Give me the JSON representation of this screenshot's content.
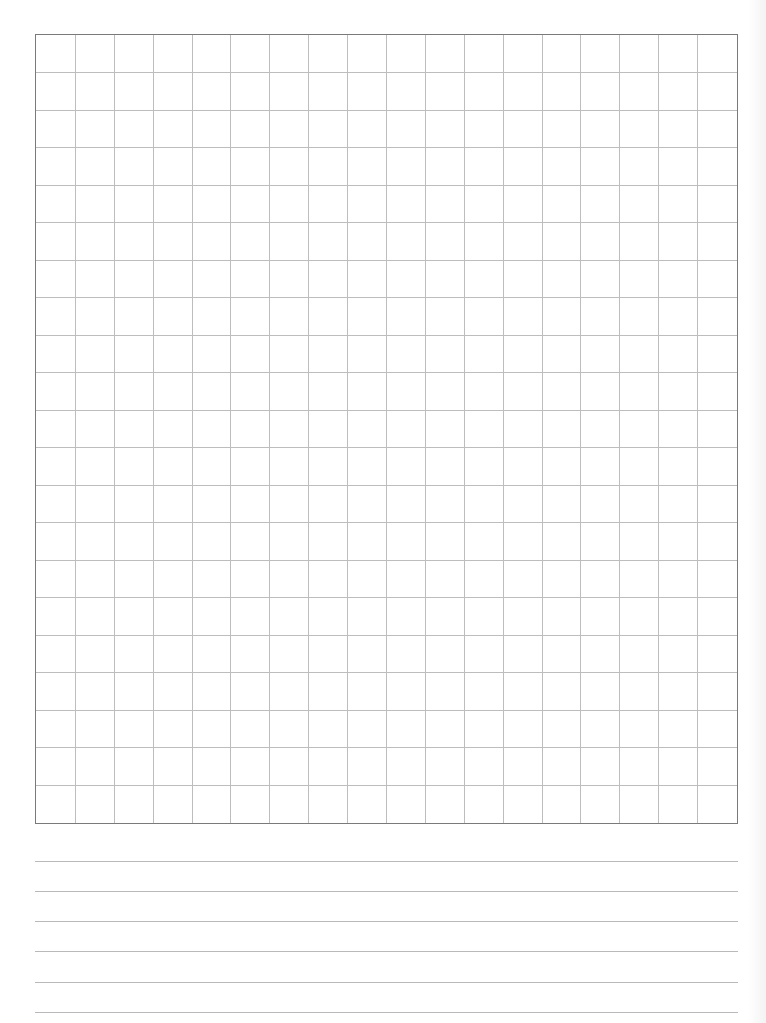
{
  "page": {
    "width": 766,
    "height": 1023,
    "background": "#ffffff"
  },
  "grid": {
    "left": 35,
    "top": 34,
    "width": 703,
    "height": 790,
    "columns": 18,
    "rows": 21,
    "border_color": "#7a7a7a",
    "line_color": "#bdbdbd"
  },
  "ruled_lines": {
    "left": 35,
    "width": 703,
    "color": "#b9b9b9",
    "y_positions": [
      861,
      891,
      921,
      951,
      982,
      1012
    ]
  }
}
